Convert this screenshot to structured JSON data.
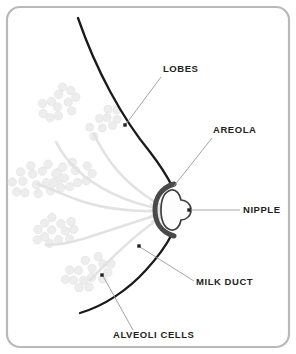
{
  "diagram": {
    "type": "anatomical-illustration",
    "labels": [
      {
        "id": "lobes",
        "text": "LOBES",
        "x": 163,
        "y": 72,
        "anchor": "start",
        "leader": {
          "from_x": 161,
          "from_y": 77,
          "to_x": 126,
          "to_y": 124
        },
        "dot": {
          "x": 125,
          "y": 125
        }
      },
      {
        "id": "areola",
        "text": "AREOLA",
        "x": 213,
        "y": 133,
        "anchor": "start",
        "leader": {
          "from_x": 212,
          "from_y": 138,
          "to_x": 174,
          "to_y": 186
        },
        "dot": null
      },
      {
        "id": "nipple",
        "text": "NIPPLE",
        "x": 243,
        "y": 213,
        "anchor": "start",
        "leader": {
          "from_x": 240,
          "from_y": 210,
          "to_x": 190,
          "to_y": 210
        },
        "dot": {
          "x": 189,
          "y": 210
        }
      },
      {
        "id": "milk-duct",
        "text": "MILK DUCT",
        "x": 196,
        "y": 285,
        "anchor": "start",
        "leader": {
          "from_x": 194,
          "from_y": 281,
          "to_x": 140,
          "to_y": 247
        },
        "dot": {
          "x": 139,
          "y": 246
        }
      },
      {
        "id": "alveoli-cells",
        "text": "ALVEOLI CELLS",
        "x": 113,
        "y": 338,
        "anchor": "start",
        "leader": {
          "from_x": 133,
          "from_y": 330,
          "to_x": 103,
          "to_y": 276
        },
        "dot": {
          "x": 102,
          "y": 275
        }
      }
    ],
    "colors": {
      "frame": "#b9b9b9",
      "outline": "#1a1a1a",
      "areola": "#4a4a4a",
      "nipple_fill": "#fdfdfd",
      "duct": "#e2e2e2",
      "alveoli": "#ededed",
      "alveoli_stroke": "#e4e4e4",
      "label": "#231f20",
      "leader": "#9a9a9a",
      "background": "#ffffff"
    },
    "frame": {
      "x": 7,
      "y": 7,
      "width": 282,
      "height": 340,
      "radius": 13,
      "stroke_width": 2.2
    },
    "outline_path": "M 78 18 C 96 70, 122 118, 150 152 C 160 165, 167 176, 172 186 M 172 234 C 166 246, 157 258, 146 270 C 128 290, 104 306, 80 313",
    "areola_arc": {
      "cx": 172,
      "cy": 210,
      "rx": 14,
      "ry": 26,
      "stroke_width": 4.5
    },
    "nipple_shape": "protruding-dome",
    "alveoli_clusters": [
      {
        "id": "cluster-upper-left",
        "cx": 60,
        "cy": 103,
        "count": 14,
        "r": 4.2,
        "spread": 15,
        "angle": -38
      },
      {
        "id": "cluster-upper-mid",
        "cx": 103,
        "cy": 122,
        "count": 11,
        "r": 4.0,
        "spread": 12,
        "angle": -40
      },
      {
        "id": "cluster-mid-left",
        "cx": 37,
        "cy": 180,
        "count": 16,
        "r": 4.2,
        "spread": 17,
        "angle": -15
      },
      {
        "id": "cluster-mid-inner",
        "cx": 73,
        "cy": 175,
        "count": 12,
        "r": 4.2,
        "spread": 14,
        "angle": -20
      },
      {
        "id": "cluster-lower-left",
        "cx": 55,
        "cy": 230,
        "count": 13,
        "r": 4.2,
        "spread": 15,
        "angle": -10
      },
      {
        "id": "cluster-lower-mid",
        "cx": 88,
        "cy": 272,
        "count": 15,
        "r": 4.2,
        "spread": 16,
        "angle": -25
      }
    ],
    "duct_branches": [
      "M 168 210 C 140 206, 110 196, 84 176 C 72 166, 62 154, 56 142",
      "M 168 211 C 138 212, 106 210, 78 200 C 62 194, 48 188, 38 184",
      "M 168 212 C 142 219, 112 230, 86 238 C 70 243, 56 245, 46 245",
      "M 168 213 C 146 226, 124 246, 108 262 C 100 270, 94 276, 90 280",
      "M 168 209 C 146 198, 126 182, 112 164 C 104 153, 98 143, 94 134"
    ]
  }
}
